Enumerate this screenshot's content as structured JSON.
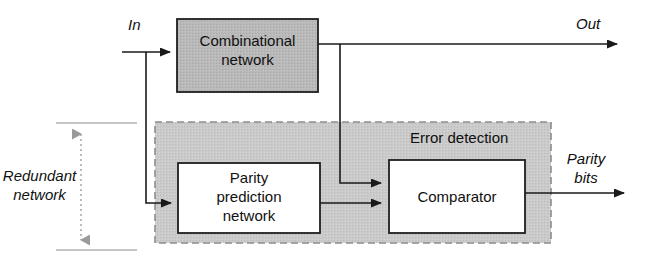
{
  "diagram": {
    "type": "block-diagram",
    "colors": {
      "background": "#ffffff",
      "line": "#1a1a1a",
      "combinational_fill": "#b8b8b8",
      "error_detection_fill": "#c9c9c9",
      "error_detection_border": "#8a8a8a",
      "white_block_fill": "#ffffff",
      "block_border": "#1a1a1a",
      "dotted_arrow": "#8a8a8a"
    },
    "blocks": [
      {
        "id": "combinational-network",
        "label": "Combinational\nnetwork",
        "fill": "shaded",
        "x": 177,
        "y": 19,
        "w": 141,
        "h": 73
      },
      {
        "id": "parity-prediction-network",
        "label": "Parity\nprediction\nnetwork",
        "fill": "white",
        "x": 178,
        "y": 163,
        "w": 142,
        "h": 70
      },
      {
        "id": "comparator",
        "label": "Comparator",
        "fill": "white",
        "x": 389,
        "y": 160,
        "w": 136,
        "h": 73
      }
    ],
    "regions": [
      {
        "id": "error-detection",
        "label": "Error detection",
        "style": "dashed-shaded",
        "x": 155,
        "y": 122,
        "w": 396,
        "h": 121
      }
    ],
    "signals": [
      {
        "id": "in",
        "label": "In",
        "kind": "input"
      },
      {
        "id": "out",
        "label": "Out",
        "kind": "output"
      },
      {
        "id": "parity-bits",
        "label": "Parity\nbits",
        "kind": "output"
      }
    ],
    "annotations": [
      {
        "id": "redundant-network",
        "label": "Redundant\nnetwork",
        "style": "dotted-double-arrow-bracket"
      }
    ]
  }
}
